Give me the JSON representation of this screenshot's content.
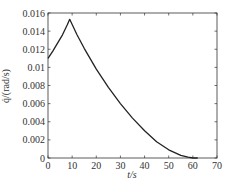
{
  "chart_data": {
    "type": "line",
    "title": "",
    "xlabel": "t/s",
    "ylabel": "q̇/(rad/s)",
    "xlim": [
      0,
      70
    ],
    "ylim": [
      0,
      0.016
    ],
    "xticks": [
      0,
      10,
      20,
      30,
      40,
      50,
      60,
      70
    ],
    "xtick_labels": [
      "0",
      "10",
      "20",
      "30",
      "40",
      "50",
      "60",
      "70"
    ],
    "yticks": [
      0,
      0.002,
      0.004,
      0.006,
      0.008,
      0.01,
      0.012,
      0.014,
      0.016
    ],
    "ytick_labels": [
      "0",
      "0.002",
      "0.004",
      "0.006",
      "0.008",
      "0.01",
      "0.012",
      "0.014",
      "0.016"
    ],
    "grid": false,
    "legend": null,
    "series": [
      {
        "name": "q̇",
        "color": "#222222",
        "x": [
          0,
          2,
          4,
          6,
          8,
          9,
          12,
          15,
          20,
          25,
          30,
          35,
          40,
          45,
          50,
          55,
          58,
          60,
          62
        ],
        "y": [
          0.011,
          0.0118,
          0.0127,
          0.0136,
          0.0147,
          0.0153,
          0.0136,
          0.0121,
          0.0098,
          0.0078,
          0.006,
          0.0044,
          0.003,
          0.0018,
          0.0009,
          0.0003,
          0.0001,
          0.0,
          0.0
        ]
      }
    ]
  },
  "labels": {
    "x_axis": "t/s",
    "y_axis": "q̇/(rad/s)"
  }
}
